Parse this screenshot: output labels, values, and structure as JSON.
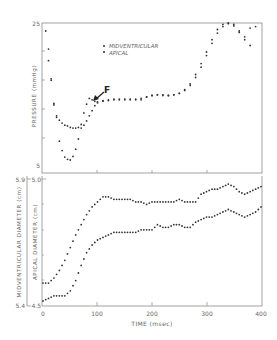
{
  "chart_data": [
    {
      "type": "scatter",
      "title": "",
      "xlabel": "TIME (msec)",
      "ylabel": "PRESSURE (mmHg)",
      "xlim": [
        0,
        400
      ],
      "ylim": [
        5,
        25
      ],
      "y_tick_labels": [
        "5",
        "25"
      ],
      "x_ticks": [
        0,
        100,
        200,
        300,
        400
      ],
      "grid": false,
      "legend_position": "upper-center",
      "legend": [
        "MIDVENTRICULAR",
        "APICAL"
      ],
      "annotations": [
        {
          "text": "F",
          "x": 85,
          "y": 16.3,
          "arrow": true
        }
      ],
      "series": [
        {
          "name": "MIDVENTRICULAR",
          "marker": "dot",
          "x": [
            5,
            10,
            15,
            20,
            25,
            30,
            35,
            40,
            45,
            50,
            55,
            60,
            65,
            70,
            75,
            80,
            85,
            90,
            95,
            100,
            110,
            120,
            130,
            140,
            150,
            160,
            170,
            180,
            190,
            200,
            210,
            220,
            230,
            240,
            250,
            260,
            270,
            280,
            290,
            300,
            310,
            320,
            330,
            340,
            350,
            360,
            370,
            380
          ],
          "values": [
            23.9,
            19.8,
            17.3,
            13.7,
            12.0,
            8.7,
            7.4,
            6.5,
            6.2,
            6.1,
            6.6,
            7.6,
            9.0,
            11.0,
            12.6,
            13.8,
            14.6,
            14.4,
            14.2,
            14.1,
            14.3,
            14.4,
            14.5,
            14.4,
            14.5,
            14.4,
            14.5,
            14.4,
            14.8,
            15.0,
            15.1,
            15.1,
            15.0,
            15.1,
            15.3,
            15.8,
            16.6,
            17.9,
            19.4,
            21.0,
            22.7,
            24.1,
            24.8,
            25.0,
            24.8,
            23.9,
            23.1,
            24.3
          ]
        },
        {
          "name": "APICAL",
          "marker": "dot",
          "x": [
            10,
            15,
            20,
            25,
            30,
            35,
            40,
            45,
            50,
            55,
            60,
            65,
            70,
            75,
            80,
            85,
            90,
            95,
            100,
            110,
            120,
            130,
            140,
            150,
            160,
            170,
            180,
            190,
            200,
            210,
            220,
            230,
            240,
            250,
            260,
            270,
            280,
            290,
            300,
            310,
            320,
            330,
            340,
            350,
            360,
            370,
            380,
            390
          ],
          "values": [
            21.4,
            17.1,
            13.9,
            12.2,
            11.6,
            11.2,
            10.9,
            10.8,
            10.6,
            10.5,
            10.5,
            10.6,
            10.5,
            10.9,
            11.5,
            12.2,
            12.9,
            13.6,
            14.0,
            14.2,
            14.3,
            14.4,
            14.5,
            14.4,
            14.5,
            14.4,
            14.6,
            14.8,
            15.0,
            15.1,
            15.0,
            15.0,
            15.1,
            15.3,
            15.7,
            16.4,
            17.5,
            18.9,
            20.5,
            22.2,
            23.6,
            24.5,
            24.9,
            24.6,
            23.7,
            22.7,
            21.9,
            24.5
          ]
        }
      ]
    },
    {
      "type": "scatter",
      "title": "",
      "xlabel": "TIME (msec)",
      "ylabel_left_outer": "MIDVENTRICULAR DIAMETER (cm)",
      "ylabel_left_inner": "APICAL DIAMETER (cm)",
      "xlim": [
        0,
        400
      ],
      "ylim_midventricular": [
        5.4,
        5.9
      ],
      "ylim_apical": [
        4.5,
        5.0
      ],
      "x_ticks": [
        0,
        100,
        200,
        300,
        400
      ],
      "x_tick_labels": [
        "0",
        "100",
        "200",
        "300",
        "400"
      ],
      "grid": false,
      "series": [
        {
          "name": "MIDVENTRICULAR",
          "axis": "outer",
          "marker": "dot",
          "x": [
            0,
            10,
            20,
            30,
            40,
            50,
            60,
            70,
            80,
            90,
            100,
            110,
            120,
            130,
            140,
            150,
            160,
            170,
            180,
            190,
            200,
            210,
            220,
            230,
            240,
            250,
            260,
            270,
            280,
            290,
            300,
            310,
            320,
            330,
            340,
            350,
            360,
            370,
            380,
            390,
            400
          ],
          "values": [
            5.49,
            5.49,
            5.51,
            5.54,
            5.58,
            5.63,
            5.68,
            5.72,
            5.76,
            5.79,
            5.81,
            5.83,
            5.83,
            5.82,
            5.82,
            5.82,
            5.82,
            5.81,
            5.81,
            5.8,
            5.81,
            5.81,
            5.81,
            5.81,
            5.81,
            5.82,
            5.81,
            5.81,
            5.81,
            5.84,
            5.85,
            5.86,
            5.86,
            5.87,
            5.88,
            5.87,
            5.85,
            5.84,
            5.85,
            5.86,
            5.87
          ]
        },
        {
          "name": "APICAL",
          "axis": "inner",
          "marker": "dot",
          "x": [
            0,
            10,
            20,
            30,
            40,
            50,
            60,
            70,
            80,
            90,
            100,
            110,
            120,
            130,
            140,
            150,
            160,
            170,
            180,
            190,
            200,
            210,
            220,
            230,
            240,
            250,
            260,
            270,
            280,
            290,
            300,
            310,
            320,
            330,
            340,
            350,
            360,
            370,
            380,
            390,
            400
          ],
          "values": [
            4.52,
            4.53,
            4.54,
            4.54,
            4.54,
            4.56,
            4.6,
            4.66,
            4.71,
            4.74,
            4.76,
            4.77,
            4.78,
            4.79,
            4.79,
            4.79,
            4.79,
            4.79,
            4.8,
            4.8,
            4.8,
            4.82,
            4.81,
            4.81,
            4.82,
            4.82,
            4.81,
            4.81,
            4.83,
            4.84,
            4.85,
            4.85,
            4.86,
            4.87,
            4.88,
            4.87,
            4.86,
            4.85,
            4.86,
            4.87,
            4.89
          ]
        }
      ]
    }
  ],
  "labels": {
    "pressure_axis": "PRESSURE (mmHg)",
    "pressure_top": "25",
    "pressure_bottom": "5",
    "mid_axis": "MIDVENTRICULAR DIAMETER (cm)",
    "apical_axis": "APICAL DIAMETER (cm)",
    "mid_top": "5.9",
    "mid_bottom": "5.4",
    "apical_top": "5.0",
    "apical_bottom": "4.5",
    "x_axis": "TIME (msec)",
    "x_ticks": [
      "0",
      "100",
      "200",
      "300",
      "400"
    ],
    "legend_mid": "MIDVENTRICULAR",
    "legend_apical": "APICAL",
    "annotation_f": "F"
  },
  "colors": {
    "axis": "#8a8a8a",
    "dots": "#333333",
    "text": "#666666"
  }
}
